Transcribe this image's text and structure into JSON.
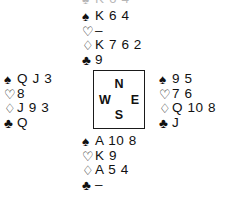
{
  "diagram": {
    "type": "bridge-deal-diagram",
    "suit_order": [
      "spades",
      "hearts",
      "diamonds",
      "clubs"
    ],
    "suit_symbols": {
      "spades": "♠",
      "hearts": "♡",
      "diamonds": "♢",
      "clubs": "♣"
    },
    "suit_icon_names": {
      "spades": "spade-suit-icon",
      "hearts": "heart-suit-icon",
      "diamonds": "diamond-suit-icon",
      "clubs": "club-suit-icon"
    },
    "void_marker": "–",
    "ink_color": "#111111",
    "background_color": "#ffffff",
    "border_color": "#1a1a1a"
  },
  "compass": {
    "north": "N",
    "west": "W",
    "east": "E",
    "south": "S"
  },
  "hands": {
    "north": {
      "position_label": "N",
      "spades": "K 6 4",
      "hearts": "–",
      "diamonds": "K 7 6 2",
      "clubs": "9"
    },
    "west": {
      "position_label": "W",
      "spades": "Q J 3",
      "hearts": "8",
      "diamonds": "J 9 3",
      "clubs": "Q"
    },
    "east": {
      "position_label": "E",
      "spades": "9 5",
      "hearts": "7 6",
      "diamonds": "Q 10 8",
      "clubs": "J"
    },
    "south": {
      "position_label": "S",
      "spades": "A 10 8",
      "hearts": "K 9",
      "diamonds": "A 5 4",
      "clubs": "–"
    }
  },
  "clipped_row": {
    "spades": "K 6 4"
  }
}
